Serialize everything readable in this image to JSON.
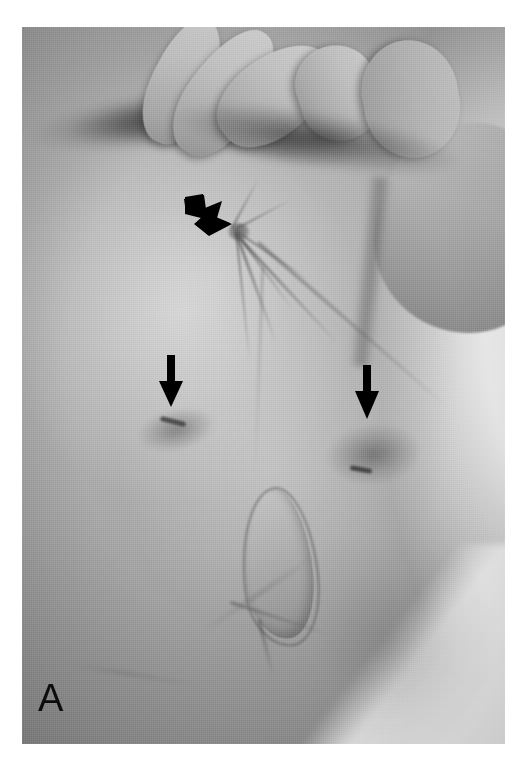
{
  "figure": {
    "panel_label": "A",
    "kind": "clinical-photograph",
    "modality": "grayscale photograph",
    "background": "white page margin"
  },
  "annotations": {
    "curved_arrow": {
      "name": "curved-arrow",
      "shape": "thick curved block arrow",
      "direction": "down-right",
      "color": "#000000",
      "points_to": "puckered umbilical scar with radiating skin folds"
    },
    "left_arrow": {
      "name": "left-straight-arrow",
      "shape": "straight solid arrow",
      "direction": "down",
      "color": "#000000",
      "points_to": "left lower abdominal hyperpigmented lesion"
    },
    "right_arrow": {
      "name": "right-straight-arrow",
      "shape": "straight solid arrow",
      "direction": "down",
      "color": "#000000",
      "points_to": "right lower abdominal hyperpigmented lesion"
    }
  },
  "palette": {
    "page_background": "#ffffff",
    "skin_midtone": "#a8a8a8",
    "skin_highlight": "#d6d6d6",
    "deep_shadow": "#1e1e1e",
    "sheet_white": "#f2f2f2",
    "annotation_black": "#000000",
    "label_color": "#0c0c0c"
  }
}
